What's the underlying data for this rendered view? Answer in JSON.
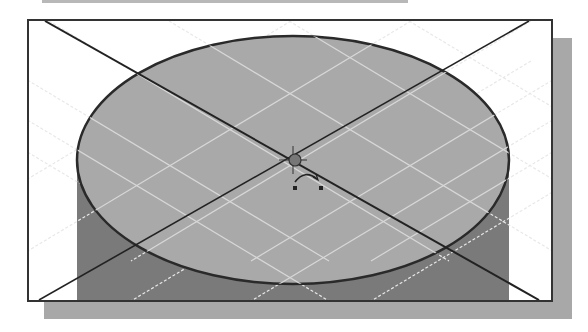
{
  "view": {
    "name": "3D model viewport",
    "content": "cylinder top face, isometric with grid",
    "colors": {
      "background": "#ffffff",
      "frame": "#333333",
      "top_face": "#a9a9a9",
      "side_face": "#7a7a7a",
      "grid": "#e6e6e6",
      "construction_lines": "#222222",
      "shadow": "#a8a8a8"
    }
  },
  "icons": {
    "origin": "origin-point-icon",
    "rotate": "rotate-cursor-icon"
  }
}
